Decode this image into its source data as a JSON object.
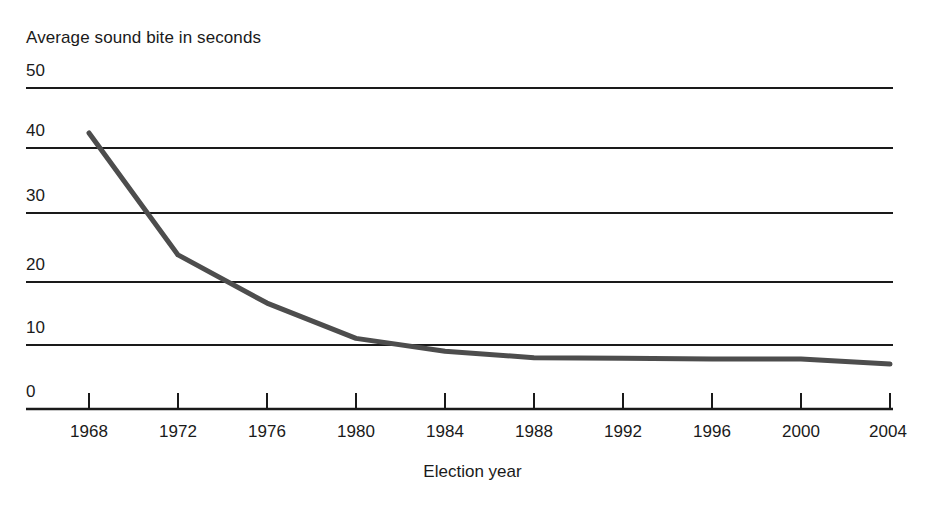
{
  "chart_data": {
    "type": "line",
    "title": "Average sound bite in seconds",
    "xlabel": "Election year",
    "ylabel": "Average sound bite in seconds",
    "x": [
      1968,
      1972,
      1976,
      1980,
      1984,
      1988,
      1992,
      1996,
      2000,
      2004
    ],
    "categories": [
      "1968",
      "1972",
      "1976",
      "1980",
      "1984",
      "1988",
      "1992",
      "1996",
      "2000",
      "2004"
    ],
    "values": [
      43,
      24,
      16.5,
      11,
      9,
      8,
      7.9,
      7.8,
      7.8,
      7
    ],
    "series": [
      {
        "name": "Average sound bite",
        "values": [
          43,
          24,
          16.5,
          11,
          9,
          8,
          7.9,
          7.8,
          7.8,
          7
        ]
      }
    ],
    "xlim": [
      1966,
      2006
    ],
    "ylim": [
      0,
      50
    ],
    "yticks": [
      0,
      10,
      20,
      30,
      40,
      50
    ],
    "ytick_labels": [
      "0",
      "10",
      "20",
      "30",
      "40",
      "50"
    ],
    "xticks": [
      1968,
      1972,
      1976,
      1980,
      1984,
      1988,
      1992,
      1996,
      2000,
      2004
    ],
    "grid": true,
    "grid_axis": "y",
    "legend": false,
    "legend_position": "none",
    "line_color": "#4d4d4d",
    "grid_color": "#1a1a1a",
    "axis_color": "#1a1a1a",
    "background_color": "#ffffff"
  },
  "axis": {
    "y_labels": [
      "50",
      "40",
      "30",
      "20",
      "10",
      "0"
    ],
    "x_labels": [
      "1968",
      "1972",
      "1976",
      "1980",
      "1984",
      "1988",
      "1992",
      "1996",
      "2000",
      "2004"
    ],
    "x_title": "Election year",
    "y_title": "Average sound bite in seconds"
  }
}
